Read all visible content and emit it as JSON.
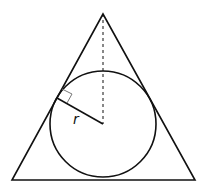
{
  "diagram": {
    "labels": {
      "radius": "r"
    },
    "colors": {
      "stroke": "#111111",
      "background": "#ffffff"
    },
    "triangle": {
      "apex": [
        103,
        14
      ],
      "base_left": [
        12,
        180
      ],
      "base_right": [
        195,
        180
      ]
    },
    "circle": {
      "center": [
        103,
        124
      ],
      "radius": 53
    },
    "radius_segment": {
      "from": [
        103,
        124
      ],
      "to": [
        57,
        98
      ]
    },
    "altitude_dashed": {
      "from": [
        103,
        14
      ],
      "to": [
        103,
        124
      ]
    },
    "right_angle_marker": true
  }
}
